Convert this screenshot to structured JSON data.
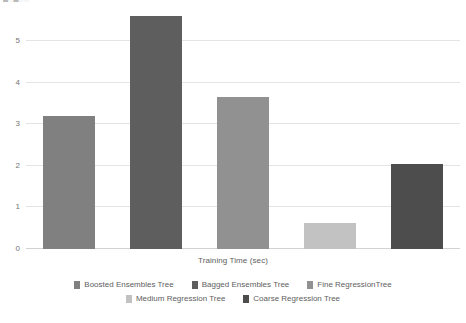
{
  "clipped_title": "█░█░░",
  "axis_title": "Training Time (sec)",
  "legend": {
    "rows": [
      [
        {
          "label": "Boosted Ensembles Tree",
          "color": "#808080"
        },
        {
          "label": "Bagged Ensembles Tree",
          "color": "#5e5e5e"
        },
        {
          "label": "Fine RegressionTree",
          "color": "#919191"
        }
      ],
      [
        {
          "label": "Medium Regression Tree",
          "color": "#c2c2c2"
        },
        {
          "label": "Coarse Regression Tree",
          "color": "#4d4d4d"
        }
      ]
    ]
  },
  "chart_data": {
    "type": "bar",
    "title": "",
    "xlabel": "Training Time (sec)",
    "ylabel": "",
    "ylim": [
      0,
      5.85
    ],
    "yticks": [
      0,
      1,
      2,
      3,
      4,
      5
    ],
    "grid": true,
    "legend_position": "bottom",
    "categories": [
      "Boosted Ensembles Tree",
      "Bagged Ensembles Tree",
      "Fine RegressionTree",
      "Medium Regression Tree",
      "Coarse Regression Tree"
    ],
    "values": [
      3.2,
      5.6,
      3.65,
      0.63,
      2.04
    ],
    "colors": [
      "#808080",
      "#5e5e5e",
      "#919191",
      "#c2c2c2",
      "#4d4d4d"
    ]
  }
}
